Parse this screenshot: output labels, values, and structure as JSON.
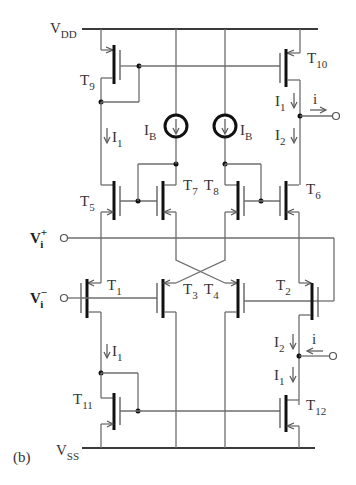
{
  "figure_label": "(b)",
  "rails": {
    "vdd": {
      "main": "V",
      "sub": "DD"
    },
    "vss": {
      "main": "V",
      "sub": "SS"
    }
  },
  "inputs": {
    "v_plus": {
      "main": "V",
      "sub": "i",
      "sup": "+"
    },
    "v_minus": {
      "main": "V",
      "sub": "i",
      "sup": "−"
    }
  },
  "transistors": [
    {
      "id": "T1",
      "main": "T",
      "sub": "1",
      "type": "pmos"
    },
    {
      "id": "T2",
      "main": "T",
      "sub": "2",
      "type": "pmos"
    },
    {
      "id": "T3",
      "main": "T",
      "sub": "3",
      "type": "pmos"
    },
    {
      "id": "T4",
      "main": "T",
      "sub": "4",
      "type": "pmos"
    },
    {
      "id": "T5",
      "main": "T",
      "sub": "5",
      "type": "nmos"
    },
    {
      "id": "T6",
      "main": "T",
      "sub": "6",
      "type": "nmos"
    },
    {
      "id": "T7",
      "main": "T",
      "sub": "7",
      "type": "nmos"
    },
    {
      "id": "T8",
      "main": "T",
      "sub": "8",
      "type": "nmos"
    },
    {
      "id": "T9",
      "main": "T",
      "sub": "9",
      "type": "pmos"
    },
    {
      "id": "T10",
      "main": "T",
      "sub": "10",
      "type": "pmos"
    },
    {
      "id": "T11",
      "main": "T",
      "sub": "11",
      "type": "nmos"
    },
    {
      "id": "T12",
      "main": "T",
      "sub": "12",
      "type": "nmos"
    }
  ],
  "current_sources": [
    {
      "main": "I",
      "sub": "B"
    },
    {
      "main": "I",
      "sub": "B"
    }
  ],
  "currents": {
    "i1": {
      "main": "I",
      "sub": "1"
    },
    "i2": {
      "main": "I",
      "sub": "2"
    },
    "out": "i"
  }
}
